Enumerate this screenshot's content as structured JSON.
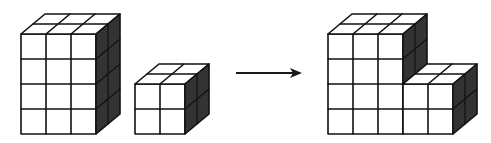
{
  "diagram": {
    "description": "Two cube stacks combine into one L-shaped stack",
    "colors": {
      "face": "#ffffff",
      "side": "#333333",
      "line": "#111111",
      "arrow": "#1a1a1a"
    },
    "cell": 25,
    "depth_step": {
      "dx": 12,
      "dy": -10
    },
    "blocks": [
      {
        "name": "tall-stack",
        "x": 21,
        "bottom": 134,
        "cols": 3,
        "rows": 4,
        "depth": 2
      },
      {
        "name": "small-stack",
        "x": 135,
        "bottom": 134,
        "cols": 2,
        "rows": 2,
        "depth": 2
      }
    ],
    "arrow": {
      "x1": 236,
      "y1": 73,
      "x2": 302,
      "y2": 73
    },
    "result": {
      "name": "combined-stack",
      "parts": [
        {
          "x": 328,
          "bottom": 134,
          "cols": 3,
          "rows": 4,
          "depth": 2
        },
        {
          "x": 403,
          "bottom": 134,
          "cols": 2,
          "rows": 2,
          "depth": 2
        }
      ]
    }
  }
}
